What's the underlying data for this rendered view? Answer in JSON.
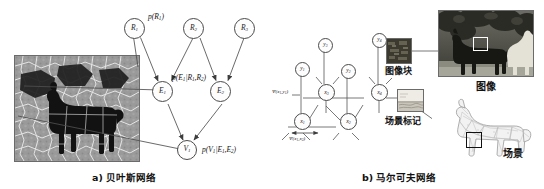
{
  "figure": {
    "panels": [
      {
        "id": "a",
        "caption": "a) 贝叶斯网络",
        "type": "bayesian-network",
        "nodes": [
          {
            "id": "R1",
            "label": "R",
            "sub": "1",
            "x": 133,
            "y": 20,
            "kind": "region"
          },
          {
            "id": "R2",
            "label": "R",
            "sub": "2",
            "x": 189,
            "y": 20,
            "kind": "region"
          },
          {
            "id": "R3",
            "label": "R",
            "sub": "3",
            "x": 240,
            "y": 20,
            "kind": "region"
          },
          {
            "id": "E1",
            "label": "E",
            "sub": "1",
            "x": 160,
            "y": 86,
            "kind": "edge"
          },
          {
            "id": "E2",
            "label": "E",
            "sub": "2",
            "x": 216,
            "y": 86,
            "kind": "edge"
          },
          {
            "id": "V1",
            "label": "V",
            "sub": "1",
            "x": 181,
            "y": 146,
            "kind": "vertex"
          }
        ],
        "edges": [
          {
            "from": "R1",
            "to": "E1"
          },
          {
            "from": "R2",
            "to": "E1"
          },
          {
            "from": "R2",
            "to": "E2"
          },
          {
            "from": "R3",
            "to": "E2"
          },
          {
            "from": "E1",
            "to": "V1"
          },
          {
            "from": "E2",
            "to": "V1"
          }
        ],
        "annotations": [
          {
            "id": "prior",
            "text": "p(R1)",
            "parts": {
              "fn": "p(",
              "v": "R",
              "sub": "1",
              "close": ")"
            }
          },
          {
            "id": "edge-cpd",
            "text": "p(E1|R1,R2)"
          },
          {
            "id": "vertex-cpd",
            "text": "p(V1|E1,E2)"
          }
        ],
        "image": {
          "name": "superpixel-segmented-horse",
          "alt": "分割图像"
        }
      },
      {
        "id": "b",
        "caption": "b) 马尔可夫网络",
        "type": "markov-network",
        "hidden_nodes": [
          {
            "id": "x1",
            "label": "x",
            "sub": "1",
            "x": 297,
            "y": 120
          },
          {
            "id": "x2",
            "label": "x",
            "sub": "2",
            "x": 343,
            "y": 120
          },
          {
            "id": "x3",
            "label": "x",
            "sub": "3",
            "x": 318,
            "y": 91
          },
          {
            "id": "x4",
            "label": "x",
            "sub": "4",
            "x": 372,
            "y": 91
          }
        ],
        "observed_nodes": [
          {
            "id": "y1",
            "label": "y",
            "sub": "1",
            "x": 295,
            "y": 62
          },
          {
            "id": "y2",
            "label": "y",
            "sub": "2",
            "x": 341,
            "y": 64
          },
          {
            "id": "y3",
            "label": "y",
            "sub": "3",
            "x": 318,
            "y": 38
          },
          {
            "id": "y4",
            "label": "y",
            "sub": "4",
            "x": 372,
            "y": 33
          }
        ],
        "potentials": [
          {
            "id": "psi-xy",
            "text": "Ψ(x1,y1)",
            "x": 273,
            "y": 88
          },
          {
            "id": "psi-xx",
            "text": "Ψ(x1,x2)",
            "x": 291,
            "y": 136
          }
        ],
        "labels": [
          {
            "id": "image-patch",
            "text": "图像块"
          },
          {
            "id": "scene-marker",
            "text": "场景标记"
          },
          {
            "id": "image",
            "text": "图像"
          },
          {
            "id": "scene",
            "text": "场景"
          }
        ],
        "thumbnails": [
          {
            "id": "patch",
            "name": "image-patch-thumb"
          },
          {
            "id": "photo",
            "name": "horse-photo"
          },
          {
            "id": "tag",
            "name": "scene-label-thumb"
          },
          {
            "id": "mesh",
            "name": "horse-mesh-scene"
          }
        ]
      }
    ],
    "colors": {
      "node_stroke": "#4a4a4a",
      "edge_stroke": "#555555",
      "text": "#111111",
      "background": "#ffffff"
    }
  }
}
